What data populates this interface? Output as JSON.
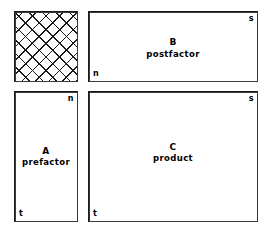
{
  "diagram": {
    "background_color": "#ffffff",
    "line_color": "#1a1a1a",
    "blocks": [
      {
        "key": "hatched",
        "symbol": "",
        "name": "",
        "fill": "cross-hatch",
        "corner_top_right": "",
        "corner_bottom_left": ""
      },
      {
        "key": "postfactor",
        "symbol": "B",
        "name": "postfactor",
        "fill": "none",
        "corner_top_right": "s",
        "corner_bottom_left": "n"
      },
      {
        "key": "prefactor",
        "symbol": "A",
        "name": "prefactor",
        "fill": "none",
        "corner_top_right": "n",
        "corner_bottom_left": "t"
      },
      {
        "key": "product",
        "symbol": "C",
        "name": "product",
        "fill": "none",
        "corner_top_right": "s",
        "corner_bottom_left": "t"
      }
    ]
  }
}
